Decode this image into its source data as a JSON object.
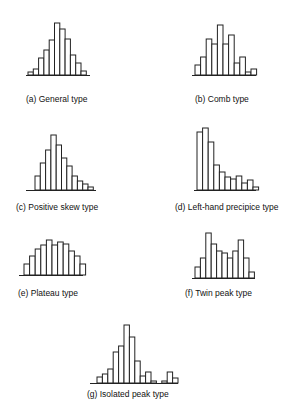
{
  "chart_data": [
    {
      "type": "bar",
      "id": "a",
      "title": "(a) General type",
      "values": [
        3,
        6,
        17,
        25,
        35,
        52,
        46,
        36,
        20,
        12,
        4
      ],
      "xlabel": "",
      "ylabel": "",
      "grid": false
    },
    {
      "type": "bar",
      "id": "b",
      "title": "(b) Comb type",
      "values": [
        10,
        18,
        36,
        31,
        50,
        31,
        40,
        12,
        18,
        3,
        6
      ],
      "xlabel": "",
      "ylabel": "",
      "grid": false
    },
    {
      "type": "bar",
      "id": "c",
      "title": "(c) Positive skew type",
      "values": [
        14,
        27,
        40,
        55,
        45,
        32,
        24,
        14,
        9,
        6,
        3
      ],
      "xlabel": "",
      "ylabel": "",
      "grid": false
    },
    {
      "type": "bar",
      "id": "d",
      "title": "(d) Left-hand precipice type",
      "values": [
        58,
        62,
        48,
        25,
        18,
        13,
        11,
        14,
        7,
        10,
        3
      ],
      "xlabel": "",
      "ylabel": "",
      "grid": false
    },
    {
      "type": "bar",
      "id": "e",
      "title": "(e) Plateau type",
      "values": [
        11,
        19,
        26,
        30,
        35,
        30,
        33,
        31,
        24,
        19,
        11
      ],
      "xlabel": "",
      "ylabel": "",
      "grid": false
    },
    {
      "type": "bar",
      "id": "f",
      "title": "(f) Twin peak type",
      "values": [
        11,
        20,
        45,
        34,
        27,
        25,
        20,
        27,
        38,
        20,
        6
      ],
      "xlabel": "",
      "ylabel": "",
      "grid": false
    },
    {
      "type": "bar",
      "id": "g",
      "title": "(g) Isolated peak type",
      "values": [
        6,
        9,
        14,
        31,
        37,
        58,
        46,
        22,
        7,
        11,
        2,
        0,
        2,
        11,
        5
      ],
      "xlabel": "",
      "ylabel": "",
      "grid": false
    }
  ],
  "captions": {
    "a": "(a) General type",
    "b": "(b) Comb type",
    "c": "(c) Positive skew type",
    "d": "(d) Left-hand precipice type",
    "e": "(e) Plateau type",
    "f": "(f) Twin peak type",
    "g": "(g) Isolated peak type"
  }
}
